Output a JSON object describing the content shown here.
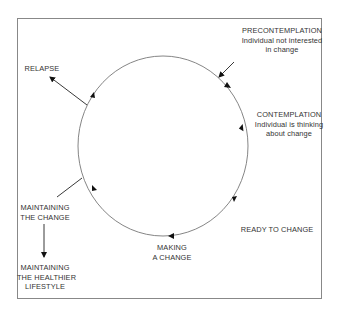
{
  "diagram": {
    "type": "cycle",
    "stages": [
      {
        "id": "precontemplation",
        "title": "PRECONTEMPLATION",
        "sub1": "Individual not interested",
        "sub2": "in change"
      },
      {
        "id": "contemplation",
        "title": "CONTEMPLATION",
        "sub1": "Individual is thinking",
        "sub2": "about change"
      },
      {
        "id": "ready",
        "title": "READY TO CHANGE"
      },
      {
        "id": "making",
        "line1": "MAKING",
        "line2": "A CHANGE"
      },
      {
        "id": "maintaining",
        "line1": "MAINTAINING",
        "line2": "THE CHANGE"
      },
      {
        "id": "relapse",
        "title": "RELAPSE"
      }
    ],
    "outcome": {
      "line1": "MAINTAINING",
      "line2": "THE HEALTHIER",
      "line3": "LIFESTYLE"
    },
    "colors": {
      "line": "#555555",
      "border": "#888888",
      "text": "#333333"
    }
  }
}
